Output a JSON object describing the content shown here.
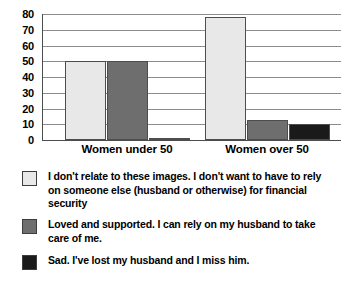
{
  "chart_data": {
    "type": "bar",
    "title": "",
    "subtitle": "",
    "xlabel": "",
    "ylabel": "",
    "categories": [
      "Women under 50",
      "Women over 50"
    ],
    "series": [
      {
        "name": "I don't relate to these images. I don't want to have to rely on someone else (husband or otherwise) for financial security",
        "color": "#e8e8e8",
        "values": [
          50,
          78
        ]
      },
      {
        "name": "Loved and supported. I can rely on my husband to take care of me.",
        "color": "#6e6e6e",
        "values": [
          50,
          13
        ]
      },
      {
        "name": "Sad. I've lost my husband and I miss him.",
        "color": "#1a1a1a",
        "values": [
          1,
          10
        ]
      }
    ],
    "ylim": [
      0,
      80
    ],
    "ytick_step": 10,
    "yticks": [
      "80",
      "70",
      "60",
      "50",
      "40",
      "30",
      "20",
      "10",
      "0"
    ],
    "grid": "horizontal",
    "legend_position": "bottom"
  },
  "legend": {
    "entries": [
      "I don't relate to these images. I don't want to have to rely on someone else (husband or otherwise) for financial security",
      "Loved and supported. I can rely on my husband to take care of me.",
      "Sad. I've lost my husband and I miss him."
    ]
  },
  "colors": {
    "series1": "#e8e8e8",
    "series2": "#6e6e6e",
    "series3": "#1a1a1a",
    "gridline": "#8c8c8c",
    "axis": "#4d4d4d",
    "text": "#000000",
    "background": "#ffffff"
  }
}
